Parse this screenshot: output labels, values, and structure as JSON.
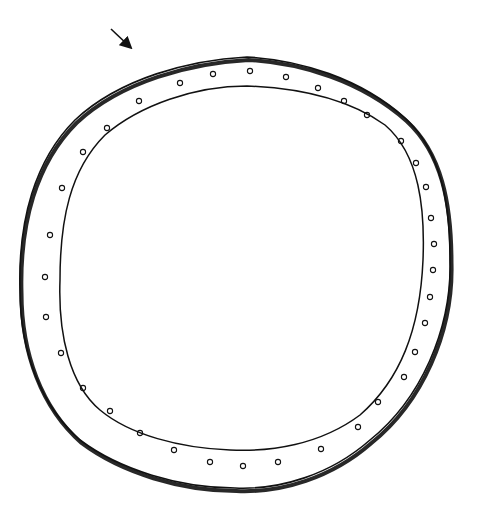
{
  "drawing": {
    "subject": "hand-drawn ring with small circles (bead band)",
    "stroke_color": "#111111",
    "background": "#ffffff",
    "arrow": {
      "from": [
        111,
        29
      ],
      "to": [
        129,
        46
      ]
    },
    "outer_path": "M247,57 C300,60 360,78 405,118 C440,150 450,200 450,260 C452,330 420,400 370,440 C330,475 280,490 235,488 C180,488 120,470 80,440 C40,405 20,350 20,290 C18,220 35,160 75,120 C120,78 190,60 247,57 Z",
    "inner_path": "M247,86 C300,88 350,100 385,125 C420,155 425,210 423,260 C420,330 400,380 360,415 C320,445 270,452 230,450 C180,448 130,435 100,410 C70,385 58,335 60,280 C60,220 70,170 105,135 C140,105 195,86 247,86 Z",
    "beads": [
      [
        139,
        101
      ],
      [
        180,
        83
      ],
      [
        213,
        74
      ],
      [
        250,
        71
      ],
      [
        286,
        77
      ],
      [
        318,
        88
      ],
      [
        344,
        101
      ],
      [
        367,
        115
      ],
      [
        401,
        141
      ],
      [
        416,
        163
      ],
      [
        426,
        187
      ],
      [
        431,
        218
      ],
      [
        434,
        244
      ],
      [
        433,
        270
      ],
      [
        430,
        297
      ],
      [
        425,
        323
      ],
      [
        415,
        352
      ],
      [
        404,
        377
      ],
      [
        378,
        402
      ],
      [
        358,
        427
      ],
      [
        321,
        449
      ],
      [
        278,
        462
      ],
      [
        243,
        466
      ],
      [
        210,
        462
      ],
      [
        174,
        450
      ],
      [
        140,
        433
      ],
      [
        110,
        411
      ],
      [
        83,
        388
      ],
      [
        61,
        353
      ],
      [
        46,
        317
      ],
      [
        45,
        277
      ],
      [
        50,
        235
      ],
      [
        62,
        188
      ],
      [
        83,
        152
      ],
      [
        107,
        128
      ]
    ]
  }
}
